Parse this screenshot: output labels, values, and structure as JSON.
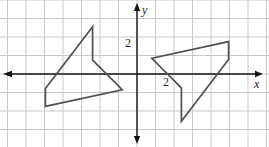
{
  "figure": {
    "background_color": "#ffffff",
    "grid": {
      "spacing_px": 18.5,
      "origin_px": {
        "x": 137,
        "y": 74
      },
      "line_color": "#c9c9c9",
      "line_width": 1
    },
    "axes": {
      "color": "#151515",
      "line_width": 1.4,
      "x_label": "x",
      "y_label": "y",
      "x_tick_label": "2",
      "y_tick_label": "2"
    },
    "shapes": [
      {
        "name": "left-pentagon",
        "stroke_color": "#4f4f4f",
        "stroke_width": 1.7,
        "fill": "none",
        "points_units": [
          [
            -2.4,
            2.55
          ],
          [
            -2.4,
            0.75
          ],
          [
            -0.8,
            -0.85
          ],
          [
            -4.95,
            -1.75
          ],
          [
            -4.95,
            -0.78
          ]
        ]
      },
      {
        "name": "right-pentagon",
        "stroke_color": "#4f4f4f",
        "stroke_width": 1.7,
        "fill": "none",
        "points_units": [
          [
            0.8,
            0.85
          ],
          [
            4.95,
            1.75
          ],
          [
            4.95,
            0.78
          ],
          [
            2.4,
            -2.55
          ],
          [
            2.4,
            -0.75
          ]
        ]
      }
    ]
  }
}
